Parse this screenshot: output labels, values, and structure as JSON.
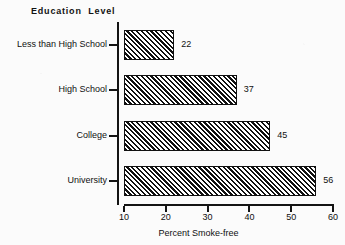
{
  "chart_data": {
    "type": "bar",
    "orientation": "horizontal",
    "title": "Education  Level",
    "xlabel": "Percent Smoke-free",
    "ylabel": "",
    "categories": [
      "Less than High School",
      "High School",
      "College",
      "University"
    ],
    "values": [
      22,
      37,
      45,
      56
    ],
    "value_labels": [
      "22",
      "37",
      "45",
      "56"
    ],
    "xlim": [
      10,
      60
    ],
    "xticks": [
      10,
      20,
      30,
      40,
      50,
      60
    ],
    "xtick_labels": [
      "10",
      "20",
      "30",
      "40",
      "50",
      "60"
    ],
    "grid": false,
    "legend": null,
    "bar_fill": "diagonal-hatch",
    "colors": {
      "axis": "#141414",
      "bar_edge": "#101010",
      "bar_hatch": "#101010",
      "bar_background": "#ffffff",
      "text": "#101010",
      "page_background": "#fbfbfb"
    }
  }
}
